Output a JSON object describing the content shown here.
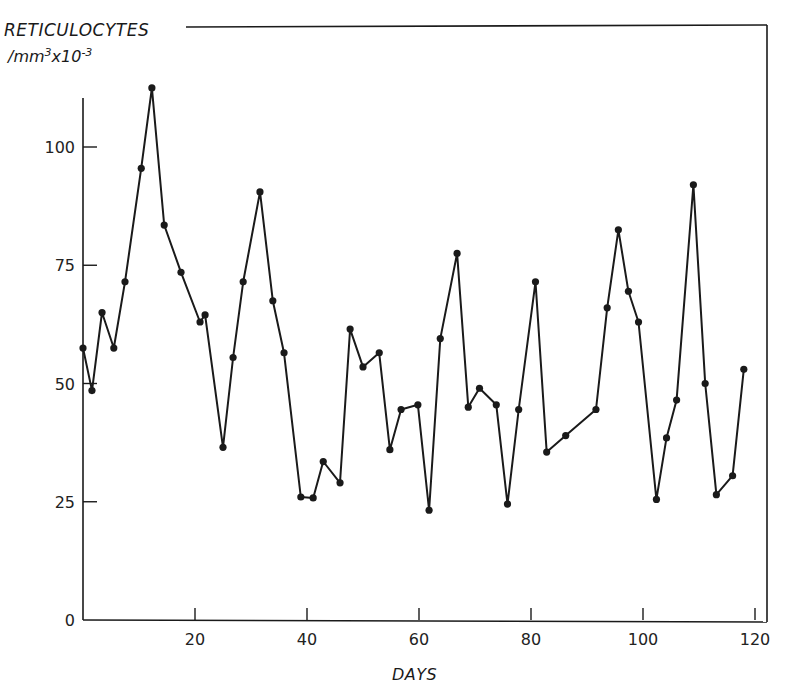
{
  "chart_data": {
    "type": "line",
    "title": "",
    "ylabel_line1": "RETICULOCYTES",
    "ylabel_line2_prefix": "/mm",
    "ylabel_line2_sup1": "3",
    "ylabel_line2_mid": "x10",
    "ylabel_line2_sup2": "-3",
    "xlabel": "DAYS",
    "xlim": [
      0,
      121
    ],
    "ylim": [
      0,
      115
    ],
    "xticks": [
      20,
      40,
      60,
      80,
      100,
      120
    ],
    "yticks": [
      0,
      25,
      50,
      75,
      100
    ],
    "ytick_labels": [
      "0",
      "25",
      "50",
      "75",
      "100"
    ],
    "xtick_labels": [
      "20",
      "40",
      "60",
      "80",
      "100",
      "120"
    ],
    "grid": false,
    "legend": null,
    "markers": true,
    "series": [
      {
        "name": "Reticulocytes",
        "x": [
          0,
          1.6,
          3.4,
          5.5,
          7.5,
          10.4,
          12.3,
          14.5,
          17.5,
          20.9,
          21.8,
          25,
          26.8,
          28.6,
          31.6,
          33.9,
          35.9,
          38.9,
          41.1,
          42.9,
          45.9,
          47.7,
          50,
          52.9,
          54.8,
          56.8,
          59.8,
          61.8,
          63.8,
          66.8,
          68.8,
          70.8,
          73.8,
          75.8,
          77.8,
          80.8,
          82.8,
          86.2,
          91.6,
          93.6,
          95.6,
          97.4,
          99.2,
          102.4,
          104.2,
          106,
          109,
          111.1,
          113.1,
          116,
          118
        ],
        "values": [
          57.5,
          48.5,
          65,
          57.5,
          71.5,
          95.5,
          112.5,
          83.5,
          73.5,
          63,
          64.5,
          36.5,
          55.5,
          71.5,
          90.5,
          67.5,
          56.5,
          26,
          25.8,
          33.5,
          29,
          61.5,
          53.5,
          56.5,
          36,
          44.5,
          45.5,
          23.2,
          59.5,
          77.5,
          45,
          49,
          45.5,
          24.5,
          44.5,
          71.5,
          35.5,
          39,
          44.5,
          66,
          82.5,
          69.5,
          63,
          25.5,
          38.5,
          46.5,
          92,
          50,
          26.5,
          30.5,
          53
        ]
      }
    ]
  }
}
